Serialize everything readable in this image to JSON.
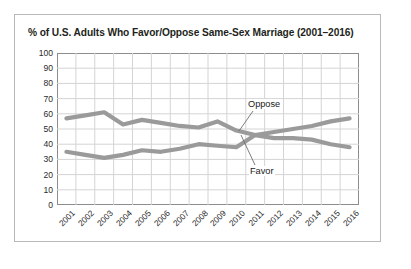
{
  "card": {
    "title": "% of U.S. Adults Who Favor/Oppose Same-Sex Marriage (2001–2016)"
  },
  "annotations": {
    "oppose_label": "Oppose",
    "favor_label": "Favor"
  },
  "colors": {
    "series_line": "#9a9a9a",
    "grid": "#d4d4d4",
    "axis": "#8d8d8d",
    "frame": "#b9b9b9",
    "text": "#231f20",
    "background": "#ffffff"
  },
  "chart_data": {
    "type": "line",
    "title": "% of U.S. Adults Who Favor/Oppose Same-Sex Marriage (2001–2016)",
    "xlabel": "",
    "ylabel": "",
    "categories": [
      "2001",
      "2002",
      "2003",
      "2004",
      "2005",
      "2006",
      "2007",
      "2008",
      "2009",
      "2010",
      "2011",
      "2012",
      "2013",
      "2014",
      "2015",
      "2016"
    ],
    "series": [
      {
        "name": "Oppose",
        "values": [
          57,
          59,
          61,
          53,
          56,
          54,
          52,
          51,
          55,
          49,
          46,
          44,
          44,
          43,
          40,
          38
        ]
      },
      {
        "name": "Favor",
        "values": [
          35,
          33,
          31,
          33,
          36,
          35,
          37,
          40,
          39,
          38,
          46,
          48,
          50,
          52,
          55,
          57
        ]
      }
    ],
    "ylim": [
      0,
      100
    ],
    "ytick_step": 10,
    "yticks": [
      0,
      10,
      20,
      30,
      40,
      50,
      60,
      70,
      80,
      90,
      100
    ],
    "grid": true,
    "legend": "annotated-inline",
    "xtick_rotation": -45
  }
}
